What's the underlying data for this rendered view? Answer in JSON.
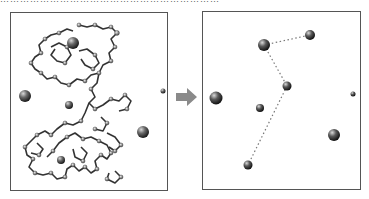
{
  "caption": "…………………………………………………………",
  "left_panel": {
    "label": "Atomistic polymer chain with ions",
    "ions": [
      {
        "cx": 62,
        "cy": 30,
        "r": 6
      },
      {
        "cx": 14,
        "cy": 83,
        "r": 6
      },
      {
        "cx": 58,
        "cy": 92,
        "r": 4
      },
      {
        "cx": 152,
        "cy": 78,
        "r": 2.5
      },
      {
        "cx": 132,
        "cy": 119,
        "r": 6
      },
      {
        "cx": 50,
        "cy": 147,
        "r": 4
      }
    ]
  },
  "arrow": {
    "direction": "right",
    "color": "#888888"
  },
  "right_panel": {
    "label": "Coarse-grained ions with dotted connections",
    "ions": [
      {
        "cx": 61,
        "cy": 33,
        "r": 6
      },
      {
        "cx": 107,
        "cy": 23,
        "r": 5
      },
      {
        "cx": 13,
        "cy": 86,
        "r": 6.5
      },
      {
        "cx": 84,
        "cy": 74,
        "r": 4.5
      },
      {
        "cx": 150,
        "cy": 82,
        "r": 2.5
      },
      {
        "cx": 57,
        "cy": 96,
        "r": 4
      },
      {
        "cx": 131,
        "cy": 123,
        "r": 6
      },
      {
        "cx": 45,
        "cy": 153,
        "r": 4.5
      }
    ],
    "links": [
      {
        "from": [
          61,
          33
        ],
        "to": [
          107,
          23
        ]
      },
      {
        "from": [
          61,
          33
        ],
        "to": [
          84,
          74
        ]
      },
      {
        "from": [
          84,
          74
        ],
        "to": [
          45,
          153
        ]
      }
    ]
  }
}
